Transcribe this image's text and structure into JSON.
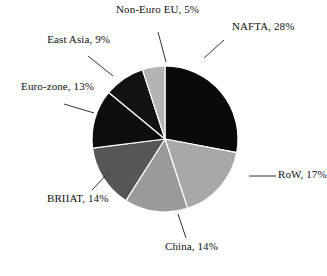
{
  "chart_data": {
    "type": "pie",
    "title": "",
    "xlabel": "",
    "ylabel": "",
    "legend_position": "none",
    "grid": false,
    "value_unit": "%",
    "total": 100,
    "categories": [
      "NAFTA",
      "RoW",
      "China",
      "BRIIAT",
      "Euro-zone",
      "East Asia",
      "Non-Euro EU"
    ],
    "values": [
      28,
      17,
      14,
      14,
      13,
      9,
      5
    ],
    "slices": [
      {
        "label": "NAFTA",
        "value": 28,
        "value_text": "28%",
        "separator": ",",
        "color": "#0a0a0a",
        "start_angle": 0,
        "end_angle": 100.8,
        "label_line1": "NAFTA,",
        "label_line2": "28%",
        "label_align": "left"
      },
      {
        "label": "RoW",
        "value": 17,
        "value_text": "17%",
        "separator": ",",
        "color": "#a8a8a8",
        "start_angle": 100.8,
        "end_angle": 162.0,
        "label_line1": "RoW,",
        "label_line2": "17%",
        "label_align": "left"
      },
      {
        "label": "China",
        "value": 14,
        "value_text": "14%",
        "separator": ",",
        "color": "#9a9a9a",
        "start_angle": 162.0,
        "end_angle": 212.4,
        "label_line1": "China,",
        "label_line2": "14%",
        "label_align": "center"
      },
      {
        "label": "BRIIAT",
        "value": 14,
        "value_text": "14%",
        "separator": ",",
        "color": "#565656",
        "start_angle": 212.4,
        "end_angle": 262.8,
        "label_line1": "BRIIAT,",
        "label_line2": "14%",
        "label_align": "center"
      },
      {
        "label": "Euro-zone",
        "value": 13,
        "value_text": "13%",
        "separator": ",",
        "color": "#0d0d0d",
        "start_angle": 262.8,
        "end_angle": 309.6,
        "label_line1": "Euro-zone,",
        "label_line2": "13%",
        "label_align": "right"
      },
      {
        "label": "East Asia",
        "value": 9,
        "value_text": "9%",
        "separator": ",",
        "color": "#121212",
        "start_angle": 309.6,
        "end_angle": 342.0,
        "label_line1": "East Asia,",
        "label_line2": "9%",
        "label_align": "right"
      },
      {
        "label": "Non-Euro EU",
        "value": 5,
        "value_text": "5%",
        "separator": ",",
        "color": "#b4b4b4",
        "start_angle": 342.0,
        "end_angle": 360.0,
        "label_line1": "Non-Euro",
        "label_line2": "EU, 5%",
        "label_align": "center"
      }
    ],
    "geometry": {
      "center_x": 165,
      "center_y": 139,
      "radius": 73,
      "start_offset_deg": -90,
      "direction": "clockwise"
    },
    "style": {
      "slice_border_color": "#ffffff",
      "slice_border_width": 1.2,
      "leader_line_color": "#333333",
      "background": "#ffffff",
      "text_color": "#111111"
    }
  }
}
